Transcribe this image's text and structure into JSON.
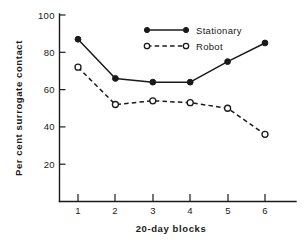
{
  "chart_data": {
    "type": "line",
    "title": "",
    "xlabel": "20-day blocks",
    "ylabel": "Per cent surrogate contact",
    "categories": [
      "1",
      "2",
      "3",
      "4",
      "5",
      "6"
    ],
    "x": [
      1,
      2,
      3,
      4,
      5,
      6
    ],
    "xlim": [
      0.35,
      7.0
    ],
    "ylim": [
      0,
      100
    ],
    "yticks": [
      20,
      40,
      60,
      80,
      100
    ],
    "ytick_labels": [
      "20",
      "40",
      "60",
      "80",
      "100"
    ],
    "xticks": [
      1,
      2,
      3,
      4,
      5,
      6
    ],
    "xtick_labels": [
      "1",
      "2",
      "3",
      "4",
      "5",
      "6"
    ],
    "grid": false,
    "legend_position": "upper right inside",
    "series": [
      {
        "name": "Stationary",
        "values": [
          87,
          66,
          64,
          64,
          75,
          85
        ],
        "line_style": "solid",
        "marker": "filled-circle",
        "color": "#1a1a1a"
      },
      {
        "name": "Robot",
        "values": [
          72,
          52,
          54,
          53,
          50,
          36
        ],
        "line_style": "dashed",
        "marker": "open-circle",
        "color": "#1a1a1a"
      }
    ]
  },
  "axes": {
    "y_title": "Per cent surrogate contact",
    "x_title": "20-day blocks",
    "y_tick_labels": [
      "100",
      "80",
      "60",
      "40",
      "20"
    ],
    "x_tick_labels": [
      "1",
      "2",
      "3",
      "4",
      "5",
      "6"
    ]
  },
  "legend": {
    "entries": [
      {
        "label": "Stationary",
        "style": "solid-filled"
      },
      {
        "label": "Robot",
        "style": "dashed-open"
      }
    ]
  },
  "colors": {
    "ink": "#1a1a1a",
    "background": "#ffffff"
  }
}
